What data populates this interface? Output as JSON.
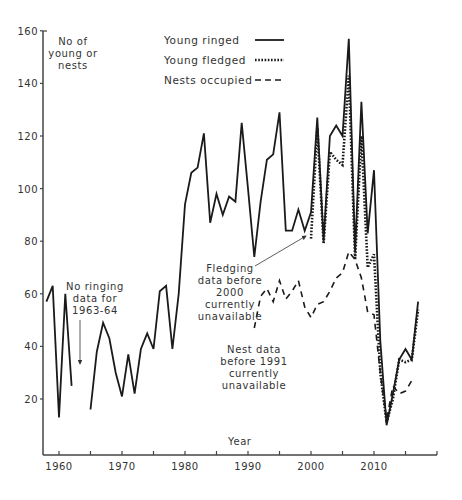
{
  "chart_data": {
    "type": "line",
    "title": "",
    "xlabel": "Year",
    "ylabel": "No of young or nests",
    "ylabel_lines": [
      "No of",
      "young or",
      "nests"
    ],
    "xlim": [
      1958,
      2019
    ],
    "ylim": [
      10,
      160
    ],
    "grid": false,
    "legend_position": "top-center",
    "x_ticks": [
      1960,
      1970,
      1980,
      1990,
      2000,
      2010
    ],
    "x_minor_ticks": [
      1965,
      1975,
      1985,
      1995,
      2005,
      2015
    ],
    "y_ticks": [
      20,
      40,
      60,
      80,
      100,
      120,
      140,
      160
    ],
    "series": [
      {
        "name": "Young ringed",
        "style": "solid",
        "points": [
          [
            1958,
            57
          ],
          [
            1959,
            63
          ],
          [
            1960,
            13
          ],
          [
            1961,
            60
          ],
          [
            1962,
            25
          ],
          [
            1965,
            16
          ],
          [
            1966,
            38
          ],
          [
            1967,
            49
          ],
          [
            1968,
            43
          ],
          [
            1969,
            30
          ],
          [
            1970,
            21
          ],
          [
            1971,
            37
          ],
          [
            1972,
            22
          ],
          [
            1973,
            39
          ],
          [
            1974,
            45
          ],
          [
            1975,
            39
          ],
          [
            1976,
            61
          ],
          [
            1977,
            63
          ],
          [
            1978,
            39
          ],
          [
            1979,
            60
          ],
          [
            1980,
            94
          ],
          [
            1981,
            106
          ],
          [
            1982,
            108
          ],
          [
            1983,
            121
          ],
          [
            1984,
            87
          ],
          [
            1985,
            98
          ],
          [
            1986,
            90
          ],
          [
            1987,
            97
          ],
          [
            1988,
            95
          ],
          [
            1989,
            125
          ],
          [
            1990,
            100
          ],
          [
            1991,
            74
          ],
          [
            1992,
            95
          ],
          [
            1993,
            111
          ],
          [
            1994,
            113
          ],
          [
            1995,
            129
          ],
          [
            1996,
            84
          ],
          [
            1997,
            84
          ],
          [
            1998,
            92
          ],
          [
            1999,
            84
          ],
          [
            2000,
            91
          ],
          [
            2001,
            127
          ],
          [
            2002,
            80
          ],
          [
            2003,
            120
          ],
          [
            2004,
            124
          ],
          [
            2005,
            120
          ],
          [
            2006,
            157
          ],
          [
            2007,
            76
          ],
          [
            2008,
            133
          ],
          [
            2009,
            83
          ],
          [
            2010,
            107
          ],
          [
            2011,
            42
          ],
          [
            2012,
            10
          ],
          [
            2013,
            22
          ],
          [
            2014,
            35
          ],
          [
            2015,
            39
          ],
          [
            2016,
            35
          ],
          [
            2017,
            57
          ]
        ]
      },
      {
        "name": "Young fledged",
        "style": "dotted",
        "points": [
          [
            2000,
            81
          ],
          [
            2001,
            123
          ],
          [
            2002,
            79
          ],
          [
            2003,
            114
          ],
          [
            2004,
            111
          ],
          [
            2005,
            109
          ],
          [
            2006,
            143
          ],
          [
            2007,
            73
          ],
          [
            2008,
            120
          ],
          [
            2009,
            70
          ],
          [
            2010,
            75
          ],
          [
            2011,
            30
          ],
          [
            2012,
            11
          ],
          [
            2013,
            20
          ],
          [
            2014,
            35
          ],
          [
            2015,
            34
          ],
          [
            2016,
            35
          ],
          [
            2017,
            54
          ]
        ]
      },
      {
        "name": "Nests occupied",
        "style": "dashed",
        "points": [
          [
            1991,
            47
          ],
          [
            1992,
            59
          ],
          [
            1993,
            62
          ],
          [
            1994,
            57
          ],
          [
            1995,
            65
          ],
          [
            1996,
            58
          ],
          [
            1997,
            61
          ],
          [
            1998,
            65
          ],
          [
            1999,
            55
          ],
          [
            2000,
            51
          ],
          [
            2001,
            56
          ],
          [
            2002,
            57
          ],
          [
            2003,
            61
          ],
          [
            2004,
            66
          ],
          [
            2005,
            68
          ],
          [
            2006,
            76
          ],
          [
            2007,
            73
          ],
          [
            2008,
            66
          ],
          [
            2009,
            53
          ],
          [
            2010,
            52
          ],
          [
            2011,
            30
          ],
          [
            2012,
            12
          ],
          [
            2013,
            25
          ],
          [
            2014,
            22
          ],
          [
            2015,
            23
          ],
          [
            2016,
            27
          ]
        ]
      }
    ],
    "annotations": [
      {
        "lines": [
          "No ringing",
          "data for",
          "1963-64"
        ],
        "arrow": true
      },
      {
        "lines": [
          "Fledging",
          "data before",
          "2000",
          "currently",
          "unavailable"
        ],
        "arrow": true
      },
      {
        "lines": [
          "Nest data",
          "before 1991",
          "currently",
          "unavailable"
        ],
        "arrow": false
      }
    ]
  },
  "legend": {
    "items": [
      {
        "label": "Young ringed",
        "style": "solid"
      },
      {
        "label": "Young fledged",
        "style": "dotted"
      },
      {
        "label": "Nests occupied",
        "style": "dashed"
      }
    ]
  },
  "axes": {
    "x_label": "Year",
    "y_label_lines": [
      "No of",
      "young or",
      "nests"
    ]
  },
  "colors": {
    "line": "#1a1a1a",
    "axis": "#444444",
    "text": "#333333"
  }
}
